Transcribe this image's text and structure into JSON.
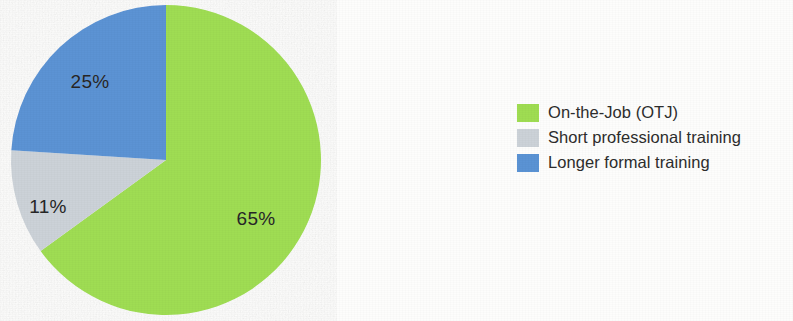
{
  "chart_data": {
    "type": "pie",
    "title": "",
    "subtitle": "",
    "xlabel": "",
    "ylabel": "",
    "grid": false,
    "legend_position": "right",
    "start_angle_deg": 0,
    "direction": "clockwise",
    "categories": [
      "On-the-Job (OTJ)",
      "Short professional training",
      "Longer formal training"
    ],
    "values": [
      65,
      11,
      25
    ],
    "value_unit": "%",
    "data_labels": [
      "65%",
      "11%",
      "25%"
    ],
    "colors": [
      "#9fdd52",
      "#ccd2d8",
      "#5b93d4"
    ],
    "slices": [
      {
        "name": "On-the-Job (OTJ)",
        "value": 65,
        "label": "65%",
        "color": "#9fdd52",
        "start_deg": 0,
        "end_deg": 234
      },
      {
        "name": "Short professional training",
        "value": 11,
        "label": "11%",
        "color": "#ccd2d8",
        "start_deg": 234,
        "end_deg": 273.6
      },
      {
        "name": "Longer formal training",
        "value": 25,
        "label": "25%",
        "color": "#5b93d4",
        "start_deg": 273.6,
        "end_deg": 360
      }
    ]
  },
  "pie": {
    "label_otj": "65%",
    "label_short": "11%",
    "label_long": "25%"
  },
  "legend": {
    "items": [
      {
        "label": "On-the-Job (OTJ)",
        "color": "#9fdd52"
      },
      {
        "label": "Short professional training",
        "color": "#ccd2d8"
      },
      {
        "label": "Longer formal training",
        "color": "#5b93d4"
      }
    ]
  },
  "colors": {
    "green": "#9fdd52",
    "gray": "#ccd2d8",
    "blue": "#5b93d4",
    "text": "#2d2d2d",
    "background": "#fdfdfc"
  }
}
